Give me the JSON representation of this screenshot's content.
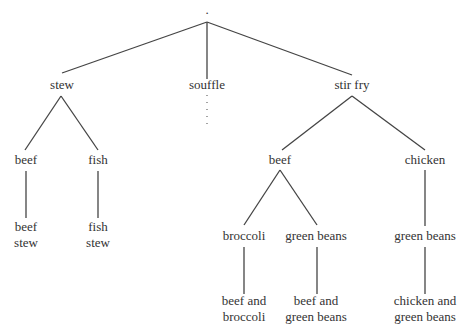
{
  "root": {
    "label": "."
  },
  "nodes": {
    "stew": "stew",
    "souffle": "souffle",
    "stir_fry": "stir fry",
    "stew_beef": "beef",
    "stew_fish": "fish",
    "stew_beef_leaf": [
      "beef",
      "stew"
    ],
    "stew_fish_leaf": [
      "fish",
      "stew"
    ],
    "sf_beef": "beef",
    "sf_chicken": "chicken",
    "sf_beef_broccoli": "broccoli",
    "sf_beef_green_beans": "green beans",
    "sf_chicken_green_beans": "green beans",
    "leaf_beef_broccoli": [
      "beef and",
      "broccoli"
    ],
    "leaf_beef_green_beans": [
      "beef and",
      "green beans"
    ],
    "leaf_chicken_green_beans": [
      "chicken and",
      "green beans"
    ]
  },
  "edges": [
    [
      "root",
      "stew"
    ],
    [
      "root",
      "souffle"
    ],
    [
      "root",
      "stir_fry"
    ],
    [
      "stew",
      "stew_beef"
    ],
    [
      "stew",
      "stew_fish"
    ],
    [
      "stew_beef",
      "stew_beef_leaf"
    ],
    [
      "stew_fish",
      "stew_fish_leaf"
    ],
    [
      "stir_fry",
      "sf_beef"
    ],
    [
      "stir_fry",
      "sf_chicken"
    ],
    [
      "sf_beef",
      "sf_beef_broccoli"
    ],
    [
      "sf_beef",
      "sf_beef_green_beans"
    ],
    [
      "sf_chicken",
      "sf_chicken_green_beans"
    ],
    [
      "sf_beef_broccoli",
      "leaf_beef_broccoli"
    ],
    [
      "sf_beef_green_beans",
      "leaf_beef_green_beans"
    ],
    [
      "sf_chicken_green_beans",
      "leaf_chicken_green_beans"
    ]
  ],
  "elided": [
    "souffle"
  ]
}
